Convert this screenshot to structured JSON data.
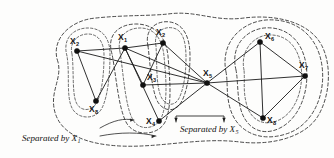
{
  "figure": {
    "background_color": "#fdfdfc",
    "ink_color": "#141414",
    "node_radius": 2.6
  },
  "nodes": [
    {
      "id": "x2_left",
      "base": "X",
      "sub": "2",
      "x": 77,
      "y": 51,
      "label_x": 70,
      "label_y": 44,
      "sub_dx": 6.0,
      "sub_dy": 2.2
    },
    {
      "id": "x1",
      "base": "X",
      "sub": "1",
      "x": 125,
      "y": 48,
      "label_x": 118,
      "label_y": 40,
      "sub_dx": 6.0,
      "sub_dy": 2.2
    },
    {
      "id": "x2_top",
      "base": "X",
      "sub": "2",
      "x": 163,
      "y": 43,
      "label_x": 156,
      "label_y": 35,
      "sub_dx": 6.0,
      "sub_dy": 2.2
    },
    {
      "id": "x8_left",
      "base": "X",
      "sub": "8",
      "x": 96,
      "y": 101,
      "label_x": 89,
      "label_y": 112,
      "sub_dx": 6.0,
      "sub_dy": 2.2
    },
    {
      "id": "x3",
      "base": "X",
      "sub": "3",
      "x": 143,
      "y": 85,
      "label_x": 147,
      "label_y": 80,
      "sub_dx": 6.0,
      "sub_dy": 2.2
    },
    {
      "id": "x4",
      "base": "X",
      "sub": "4",
      "x": 159,
      "y": 121,
      "label_x": 146,
      "label_y": 124,
      "sub_dx": 6.0,
      "sub_dy": 2.2
    },
    {
      "id": "x5",
      "base": "X",
      "sub": "5",
      "x": 207,
      "y": 83,
      "label_x": 203,
      "label_y": 76,
      "sub_dx": 6.0,
      "sub_dy": 2.2
    },
    {
      "id": "x6",
      "base": "X",
      "sub": "6",
      "x": 260,
      "y": 42,
      "label_x": 265,
      "label_y": 39,
      "sub_dx": 6.0,
      "sub_dy": 2.2
    },
    {
      "id": "x7",
      "base": "X",
      "sub": "7",
      "x": 305,
      "y": 76,
      "label_x": 299,
      "label_y": 68,
      "sub_dx": 6.0,
      "sub_dy": 2.2
    },
    {
      "id": "x8_right",
      "base": "X",
      "sub": "8",
      "x": 263,
      "y": 118,
      "label_x": 267,
      "label_y": 123,
      "sub_dx": 6.0,
      "sub_dy": 2.2
    }
  ],
  "edges": [
    {
      "from": "x2_left",
      "to": "x1"
    },
    {
      "from": "x2_left",
      "to": "x8_left"
    },
    {
      "from": "x2_left",
      "to": "x5"
    },
    {
      "from": "x1",
      "to": "x2_top"
    },
    {
      "from": "x1",
      "to": "x8_left"
    },
    {
      "from": "x1",
      "to": "x3"
    },
    {
      "from": "x1",
      "to": "x4"
    },
    {
      "from": "x1",
      "to": "x5"
    },
    {
      "from": "x2_top",
      "to": "x3"
    },
    {
      "from": "x2_top",
      "to": "x5"
    },
    {
      "from": "x3",
      "to": "x5"
    },
    {
      "from": "x4",
      "to": "x5"
    },
    {
      "from": "x5",
      "to": "x6"
    },
    {
      "from": "x5",
      "to": "x7"
    },
    {
      "from": "x5",
      "to": "x8_right"
    },
    {
      "from": "x6",
      "to": "x7"
    },
    {
      "from": "x6",
      "to": "x8_right"
    },
    {
      "from": "x7",
      "to": "x8_right"
    }
  ],
  "captions": [
    {
      "id": "sep-x1",
      "text": "Separated by X",
      "sub": "1",
      "x": 22,
      "y": 141,
      "sub_dx": 0,
      "sub_dy": 2.4
    },
    {
      "id": "sep-x5",
      "text": "Separated by X",
      "sub": "5",
      "x": 180,
      "y": 132,
      "sub_dx": 0,
      "sub_dy": 2.4
    }
  ],
  "regions": [
    {
      "id": "outer-boundary",
      "label": "outer dashed boundary"
    },
    {
      "id": "left-component-1",
      "label": "component containing X2 and X8"
    },
    {
      "id": "left-component-2",
      "label": "component containing X3 and X4"
    },
    {
      "id": "left-component-3",
      "label": "component containing X2 top"
    },
    {
      "id": "right-component-1",
      "label": "component containing X6 X7 X8"
    },
    {
      "id": "right-component-2",
      "label": "outer right component"
    }
  ]
}
